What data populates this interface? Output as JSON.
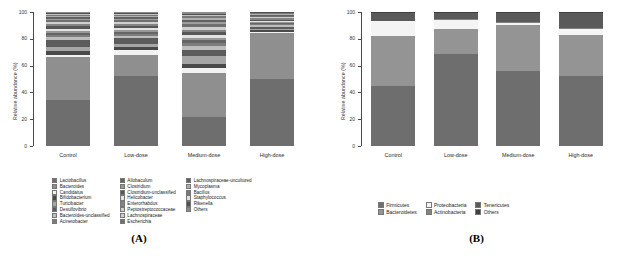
{
  "figure": {
    "panel_a_letter": "(A)",
    "panel_b_letter": "(B)"
  },
  "axis": {
    "ylabel": "Relative abundance (%)",
    "ticks": [
      "0",
      "20",
      "40",
      "60",
      "80",
      "100"
    ],
    "categories": [
      "Control",
      "Low-dose",
      "Medium-dose",
      "High-dose"
    ]
  },
  "colors": {
    "g1": "#6e6e6e",
    "g2": "#8f8f8f",
    "g3": "#f2f2f2",
    "g4": "#4a4a4a",
    "g5": "#a6a6a6",
    "g6": "#5c5c5c",
    "g7": "#bdbdbd",
    "g8": "#7d7d7d",
    "g9": "#656565",
    "g10": "#989898",
    "g11": "#e3e3e3",
    "g12": "#575757",
    "g13": "#848484",
    "g14": "#d0d0d0",
    "g15": "#707070",
    "g16": "#9f9f9f",
    "g17": "#616161",
    "g18": "#b0b0b0",
    "g19": "#787878",
    "g20": "#4f4f4f",
    "g21": "#8a8a8a",
    "g22": "#c4c4c4"
  },
  "chart_data": [
    {
      "type": "bar",
      "title": "(A) Genus-level relative abundance",
      "stacked": true,
      "xlabel": "",
      "ylabel": "Relative abundance (%)",
      "ylim": [
        0,
        100
      ],
      "yticks": [
        0,
        20,
        40,
        60,
        80,
        100
      ],
      "grid": false,
      "legend_position": "bottom",
      "categories": [
        "Control",
        "Low-dose",
        "Medium-dose",
        "High-dose"
      ],
      "series": [
        {
          "name": "Lactobacillus",
          "color": "#6e6e6e",
          "values": [
            35.0,
            53.0,
            22.0,
            50.0
          ]
        },
        {
          "name": "Bacteroides",
          "color": "#8f8f8f",
          "values": [
            32.0,
            16.0,
            32.5,
            35.0
          ]
        },
        {
          "name": "Candidatus",
          "color": "#f2f2f2",
          "values": [
            1.5,
            4.0,
            4.0,
            0.8
          ]
        },
        {
          "name": "Bifidobacterium",
          "color": "#4a4a4a",
          "values": [
            3.0,
            2.0,
            3.0,
            1.0
          ]
        },
        {
          "name": "Turicibacter",
          "color": "#a6a6a6",
          "values": [
            3.5,
            3.0,
            6.0,
            1.2
          ]
        },
        {
          "name": "Desulfovibrio",
          "color": "#5c5c5c",
          "values": [
            5.0,
            4.5,
            4.0,
            1.5
          ]
        },
        {
          "name": "Bacteroides-unclassified",
          "color": "#bdbdbd",
          "values": [
            2.0,
            1.5,
            3.0,
            1.0
          ]
        },
        {
          "name": "Acinetobacter",
          "color": "#7d7d7d",
          "values": [
            2.0,
            1.5,
            2.5,
            1.0
          ]
        },
        {
          "name": "Allobaculum",
          "color": "#656565",
          "values": [
            1.5,
            1.5,
            2.0,
            0.8
          ]
        },
        {
          "name": "Clostridium",
          "color": "#989898",
          "values": [
            1.5,
            1.5,
            2.0,
            0.8
          ]
        },
        {
          "name": "Clostridium-unclassified",
          "color": "#e3e3e3",
          "values": [
            1.5,
            1.5,
            2.0,
            0.8
          ]
        },
        {
          "name": "Helicobacter",
          "color": "#575757",
          "values": [
            2.0,
            1.5,
            2.0,
            1.0
          ]
        },
        {
          "name": "Enterorhabdus",
          "color": "#848484",
          "values": [
            1.5,
            1.5,
            2.0,
            0.8
          ]
        },
        {
          "name": "Peptostreptococcaceae",
          "color": "#d0d0d0",
          "values": [
            1.5,
            1.5,
            2.0,
            0.8
          ]
        },
        {
          "name": "Lachnospiraceae",
          "color": "#707070",
          "values": [
            1.5,
            1.5,
            2.0,
            0.8
          ]
        },
        {
          "name": "Escherichia",
          "color": "#9f9f9f",
          "values": [
            1.0,
            1.0,
            1.5,
            0.6
          ]
        },
        {
          "name": "Lachnospiraceae-uncultured",
          "color": "#616161",
          "values": [
            1.0,
            1.0,
            1.5,
            0.6
          ]
        },
        {
          "name": "Mycoplasma",
          "color": "#b0b0b0",
          "values": [
            1.0,
            1.0,
            1.5,
            0.6
          ]
        },
        {
          "name": "Bacillus",
          "color": "#787878",
          "values": [
            1.0,
            1.0,
            1.5,
            0.5
          ]
        },
        {
          "name": "Staphylococcus",
          "color": "#c4c4c4",
          "values": [
            0.8,
            0.8,
            1.0,
            0.4
          ]
        },
        {
          "name": "Rikenella",
          "color": "#4f4f4f",
          "values": [
            0.7,
            0.7,
            1.0,
            0.3
          ]
        },
        {
          "name": "Others",
          "color": "#8a8a8a",
          "values": [
            0.5,
            0.5,
            1.0,
            0.2
          ]
        }
      ]
    },
    {
      "type": "bar",
      "title": "(B) Phylum-level relative abundance",
      "stacked": true,
      "xlabel": "",
      "ylabel": "Relative abundance (%)",
      "ylim": [
        0,
        100
      ],
      "yticks": [
        0,
        20,
        40,
        60,
        80,
        100
      ],
      "grid": false,
      "legend_position": "bottom",
      "categories": [
        "Control",
        "Low-dose",
        "Medium-dose",
        "High-dose"
      ],
      "series": [
        {
          "name": "Firmicutes",
          "color": "#6e6e6e",
          "values": [
            45.0,
            69.0,
            56.0,
            52.0
          ]
        },
        {
          "name": "Bacteroidetes",
          "color": "#949494",
          "values": [
            37.0,
            18.0,
            34.5,
            31.0
          ]
        },
        {
          "name": "Proteobacteria",
          "color": "#f4f4f4",
          "values": [
            11.0,
            7.0,
            1.5,
            4.5
          ]
        },
        {
          "name": "Actinobacteria",
          "color": "#828282",
          "values": [
            0.5,
            0.5,
            0.5,
            0.5
          ]
        },
        {
          "name": "Tenericutes",
          "color": "#5a5a5a",
          "values": [
            6.0,
            5.0,
            7.0,
            11.5
          ]
        },
        {
          "name": "Others",
          "color": "#3f3f3f",
          "values": [
            0.5,
            0.5,
            0.5,
            0.5
          ]
        }
      ]
    }
  ],
  "legend_a": {
    "col1": [
      {
        "label": "Lactobacillus",
        "color": "#6e6e6e"
      },
      {
        "label": "Bacteroides",
        "color": "#8f8f8f"
      },
      {
        "label": "Candidatus",
        "color": "#f2f2f2"
      },
      {
        "label": "Bifidobacterium",
        "color": "#4a4a4a"
      },
      {
        "label": "Turicibacter",
        "color": "#a6a6a6"
      },
      {
        "label": "Desulfovibrio",
        "color": "#5c5c5c"
      },
      {
        "label": "Bacteroides-unclassified",
        "color": "#bdbdbd"
      },
      {
        "label": "Acinetobacter",
        "color": "#7d7d7d"
      }
    ],
    "col2": [
      {
        "label": "Allobaculum",
        "color": "#656565"
      },
      {
        "label": "Clostridium",
        "color": "#989898"
      },
      {
        "label": "Clostridium-unclassified",
        "color": "#575757"
      },
      {
        "label": "Helicobacter",
        "color": "#e3e3e3"
      },
      {
        "label": "Enterorhabdus",
        "color": "#848484"
      },
      {
        "label": "Peptostreptococcaceae",
        "color": "#d0d0d0"
      },
      {
        "label": "Lachnospiraceae",
        "color": "#cfcfcf"
      },
      {
        "label": "Escherichia",
        "color": "#707070"
      }
    ],
    "col3": [
      {
        "label": "Lachnospiraceae-uncultured",
        "color": "#616161"
      },
      {
        "label": "Mycoplasma",
        "color": "#b0b0b0"
      },
      {
        "label": "Bacillus",
        "color": "#787878"
      },
      {
        "label": "Staphylococcus",
        "color": "#e0e0e0"
      },
      {
        "label": "Rikenella",
        "color": "#4f4f4f"
      },
      {
        "label": "Others",
        "color": "#8a8a8a"
      }
    ]
  },
  "legend_b": {
    "col1": [
      {
        "label": "Firmicutes",
        "color": "#6e6e6e"
      },
      {
        "label": "Bacteroidetes",
        "color": "#949494"
      }
    ],
    "col2": [
      {
        "label": "Proteobacteria",
        "color": "#f4f4f4"
      },
      {
        "label": "Actinobacteria",
        "color": "#828282"
      }
    ],
    "col3": [
      {
        "label": "Tenericutes",
        "color": "#5a5a5a"
      },
      {
        "label": "Others",
        "color": "#3f3f3f"
      }
    ]
  }
}
